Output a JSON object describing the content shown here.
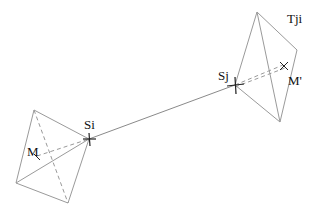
{
  "diagram": {
    "labels": {
      "si": "Si",
      "sj": "Sj",
      "tji": "Tji",
      "m": "M",
      "m_prime": "M'"
    },
    "colors": {
      "edge": "#9a9a9a",
      "connector": "#8a8a8a",
      "marker": "#222222",
      "text": "#111111"
    }
  }
}
